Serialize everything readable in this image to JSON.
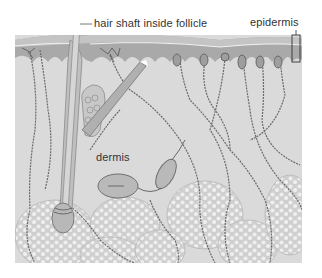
{
  "figure": {
    "labels": {
      "hair_shaft": "hair shaft inside follicle",
      "epidermis": "epidermis",
      "dermis": "dermis"
    },
    "colors": {
      "epidermis_band": "#a9a9a9",
      "epidermis_top": "#c4c4c4",
      "dermis": "#dadada",
      "fat_lobule": "#cfcfcf",
      "fat_cell": "#eeeeee",
      "nerve": "#6a6a6a",
      "hair": "#b5b5b5",
      "background": "#ffffff"
    }
  }
}
